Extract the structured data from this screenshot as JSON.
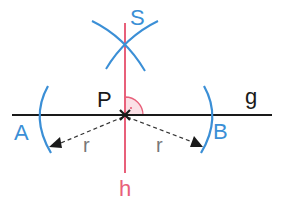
{
  "diagram": {
    "labels": {
      "S": "S",
      "P": "P",
      "g": "g",
      "A": "A",
      "B": "B",
      "h": "h",
      "r_left": "r",
      "r_right": "r"
    },
    "colors": {
      "line_g": "#1a1a1a",
      "line_h": "#e8607a",
      "arcs": "#3b8fd6",
      "labels_blue": "#3b8fd6",
      "label_black": "#1a1a1a",
      "label_h": "#e8607a",
      "radius_text": "#777777",
      "right_angle_fill": "#fbe0e6"
    }
  }
}
